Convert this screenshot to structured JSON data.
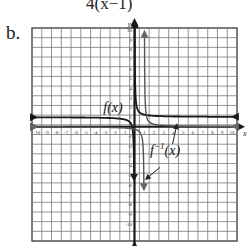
{
  "header": {
    "expression": "4(x−1)",
    "part_label": "b."
  },
  "chart_data": {
    "type": "line",
    "title": "",
    "xlabel": "x",
    "ylabel": "y",
    "xlim": [
      -10,
      10
    ],
    "ylim": [
      -10,
      10
    ],
    "grid": true,
    "x_ticks": [
      -10,
      -9,
      -8,
      -7,
      -6,
      -5,
      -4,
      -3,
      -2,
      -1,
      1,
      2,
      3,
      4,
      5,
      6,
      7,
      8,
      9,
      10
    ],
    "y_ticks": [
      -10,
      -9,
      -8,
      -7,
      -6,
      -5,
      -4,
      -3,
      -2,
      -1,
      1,
      2,
      3,
      4,
      5,
      6,
      7,
      8,
      9,
      10
    ],
    "series": [
      {
        "name": "f(x)",
        "color": "#1a1a1a",
        "description": "Hyperbola with vertical asymptote x=0 and horizontal asymptote y=1",
        "points": [
          [
            -10,
            1.05
          ],
          [
            -5,
            1.1
          ],
          [
            -2,
            1.25
          ],
          [
            -1,
            1.5
          ],
          [
            -0.5,
            2
          ],
          [
            -0.3,
            -1
          ],
          [
            -0.15,
            -5
          ],
          [
            -0.05,
            -10
          ],
          [
            0.1,
            10
          ],
          [
            0.2,
            5
          ],
          [
            0.5,
            2
          ],
          [
            1,
            1.5
          ],
          [
            2,
            1.25
          ],
          [
            5,
            1.1
          ],
          [
            10,
            1.05
          ]
        ]
      },
      {
        "name": "f^-1(x)",
        "color": "#555555",
        "description": "Inverse hyperbola with vertical asymptote x=1 and horizontal asymptote y=0",
        "points": [
          [
            -10,
            -0.05
          ],
          [
            -5,
            -0.1
          ],
          [
            -2,
            -0.25
          ],
          [
            -1,
            -0.5
          ],
          [
            0,
            -1
          ],
          [
            0.5,
            -2
          ],
          [
            0.8,
            -5
          ],
          [
            0.95,
            -10
          ],
          [
            1.1,
            10
          ],
          [
            1.2,
            5
          ],
          [
            1.5,
            2
          ],
          [
            2,
            1
          ],
          [
            3,
            0.5
          ],
          [
            5,
            0.25
          ],
          [
            10,
            0.1
          ]
        ]
      }
    ],
    "annotations": [
      {
        "text": "f(x)",
        "x": -2.2,
        "y": 1.4
      },
      {
        "text": "f^-1(x)",
        "x": 1.8,
        "y": -2.8,
        "arrows_to": [
          [
            1.0,
            -4.5
          ],
          [
            4.2,
            0.3
          ]
        ]
      }
    ]
  },
  "labels": {
    "fx": "f(x)",
    "finv_base": "f",
    "finv_sup": "−1",
    "finv_arg": "(x)",
    "x_axis": "x",
    "y_axis": "y"
  }
}
